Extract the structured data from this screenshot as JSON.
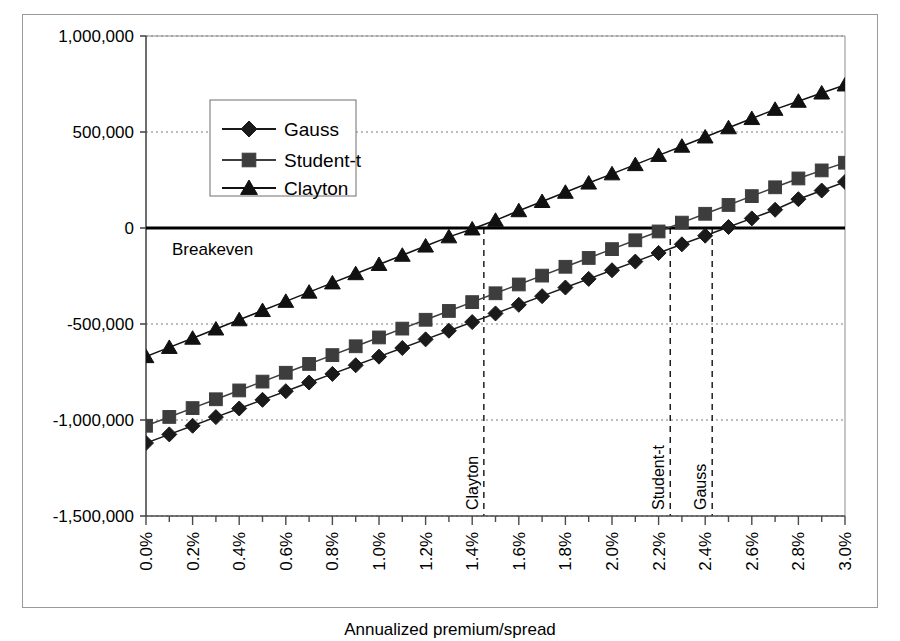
{
  "chart_data": {
    "type": "line",
    "title": "",
    "xlabel": "Annualized premium/spread",
    "ylabel": "",
    "xlim": [
      0.0,
      3.0
    ],
    "ylim": [
      -1500000,
      1000000
    ],
    "grid": true,
    "legend_position": "upper-left-inside",
    "x_unit": "%",
    "x": [
      0.0,
      0.1,
      0.2,
      0.3,
      0.4,
      0.5,
      0.6,
      0.7,
      0.8,
      0.9,
      1.0,
      1.1,
      1.2,
      1.3,
      1.4,
      1.5,
      1.6,
      1.7,
      1.8,
      1.9,
      2.0,
      2.1,
      2.2,
      2.3,
      2.4,
      2.5,
      2.6,
      2.7,
      2.8,
      2.9,
      3.0
    ],
    "x_tick_labels": [
      "0.0%",
      "0.2%",
      "0.4%",
      "0.6%",
      "0.8%",
      "1.0%",
      "1.2%",
      "1.4%",
      "1.6%",
      "1.8%",
      "2.0%",
      "2.2%",
      "2.4%",
      "2.6%",
      "2.8%",
      "3.0%"
    ],
    "x_tick_values": [
      0.0,
      0.2,
      0.4,
      0.6,
      0.8,
      1.0,
      1.2,
      1.4,
      1.6,
      1.8,
      2.0,
      2.2,
      2.4,
      2.6,
      2.8,
      3.0
    ],
    "y_tick_labels": [
      "1,000,000",
      "500,000",
      "0",
      "-500,000",
      "-1,000,000",
      "-1,500,000"
    ],
    "y_tick_values": [
      1000000,
      500000,
      0,
      -500000,
      -1000000,
      -1500000
    ],
    "series": [
      {
        "name": "Gauss",
        "marker": "diamond",
        "color": "#1a1a1a",
        "values": [
          -1120000,
          -1075000,
          -1030000,
          -985000,
          -940000,
          -895000,
          -850000,
          -805000,
          -760000,
          -715000,
          -670000,
          -625000,
          -580000,
          -535000,
          -490000,
          -445000,
          -400000,
          -355000,
          -310000,
          -265000,
          -220000,
          -175000,
          -130000,
          -85000,
          -40000,
          5000,
          50000,
          95000,
          150000,
          195000,
          240000
        ]
      },
      {
        "name": "Student-t",
        "marker": "square",
        "color": "#3d3d3d",
        "values": [
          -1030000,
          -984000,
          -938000,
          -892000,
          -846000,
          -800000,
          -754000,
          -708000,
          -662000,
          -616000,
          -570000,
          -524000,
          -478000,
          -432000,
          -386000,
          -340000,
          -294000,
          -248000,
          -202000,
          -156000,
          -110000,
          -64000,
          -18000,
          28000,
          74000,
          120000,
          166000,
          212000,
          258000,
          300000,
          340000
        ]
      },
      {
        "name": "Clayton",
        "marker": "triangle",
        "color": "#111111",
        "values": [
          -670000,
          -622000,
          -574000,
          -526000,
          -478000,
          -430000,
          -382000,
          -334000,
          -286000,
          -238000,
          -190000,
          -142000,
          -94000,
          -46000,
          -5000,
          40000,
          90000,
          138000,
          186000,
          234000,
          282000,
          330000,
          378000,
          426000,
          474000,
          522000,
          570000,
          618000,
          660000,
          703000,
          745000
        ]
      }
    ],
    "annotations": {
      "breakeven_label": "Breakeven",
      "breakeven_value": 0
    },
    "vertical_markers": [
      {
        "label": "Clayton",
        "x": 1.45
      },
      {
        "label": "Student-t",
        "x": 2.25
      },
      {
        "label": "Gauss",
        "x": 2.43
      }
    ]
  },
  "legend": {
    "items": [
      {
        "label": "Gauss"
      },
      {
        "label": "Student-t"
      },
      {
        "label": "Clayton"
      }
    ]
  }
}
